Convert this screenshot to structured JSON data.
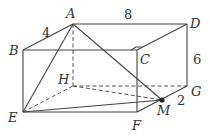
{
  "figure": {
    "type": "rectangular-prism",
    "vertices": {
      "A": {
        "label": "A",
        "x": 73,
        "y": 24,
        "lx": 66,
        "ly": 18
      },
      "B": {
        "label": "B",
        "x": 23,
        "y": 50,
        "lx": 10,
        "ly": 55
      },
      "C": {
        "label": "C",
        "x": 137,
        "y": 50,
        "lx": 140,
        "ly": 64
      },
      "D": {
        "label": "D",
        "x": 187,
        "y": 24,
        "lx": 190,
        "ly": 28
      },
      "E": {
        "label": "E",
        "x": 23,
        "y": 112,
        "lx": 10,
        "ly": 122
      },
      "F": {
        "label": "F",
        "x": 137,
        "y": 112,
        "lx": 132,
        "ly": 130
      },
      "G": {
        "label": "G",
        "x": 187,
        "y": 86,
        "lx": 190,
        "ly": 96
      },
      "H": {
        "label": "H",
        "x": 73,
        "y": 86,
        "lx": 58,
        "ly": 84
      },
      "M": {
        "label": "M",
        "x": 162,
        "y": 100,
        "lx": 160,
        "ly": 115
      }
    },
    "dimensions": [
      {
        "value": "4",
        "x": 42,
        "y": 36,
        "edge": "AB"
      },
      {
        "value": "8",
        "x": 124,
        "y": 19,
        "edge": "AD"
      },
      {
        "value": "6",
        "x": 193,
        "y": 63,
        "edge": "DG"
      },
      {
        "value": "2",
        "x": 178,
        "y": 104,
        "edge": "MG"
      }
    ]
  }
}
